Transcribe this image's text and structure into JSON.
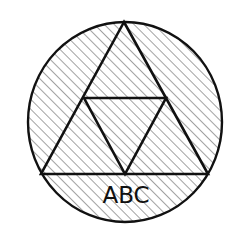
{
  "diagram": {
    "label": "ABC",
    "colors": {
      "stroke": "#111111",
      "hatch": "#8a8a8a",
      "background": "#ffffff"
    },
    "shapes": {
      "circle": {
        "cx": 125,
        "cy": 122,
        "rx": 97,
        "ry": 100
      },
      "outer_triangle": {
        "apex": [
          124,
          22
        ],
        "left": [
          41,
          174
        ],
        "right": [
          208,
          174
        ]
      },
      "inner_triangle": {
        "left": [
          84,
          98
        ],
        "right": [
          166,
          98
        ],
        "bottom": [
          125,
          174
        ]
      }
    },
    "fill_pattern": "diagonal-hatch"
  }
}
